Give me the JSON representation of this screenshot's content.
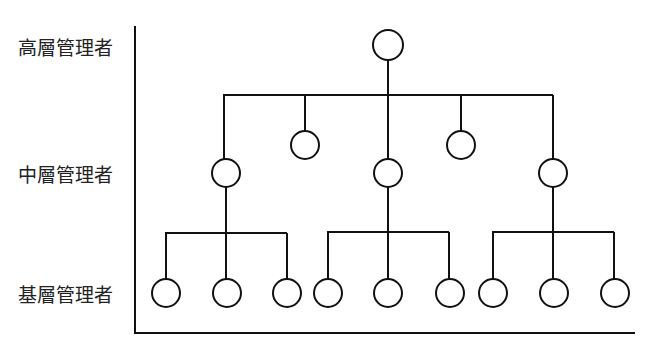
{
  "diagram": {
    "title": "",
    "type": "organization-hierarchy",
    "levels": [
      {
        "id": "top",
        "label": "高層管理者",
        "y": 45
      },
      {
        "id": "middle",
        "label": "中層管理者",
        "y": 173
      },
      {
        "id": "base",
        "label": "基層管理者",
        "y": 293
      }
    ],
    "colors": {
      "stroke": "#111111",
      "background": "#ffffff",
      "text": "#222222"
    },
    "nodes": [
      {
        "id": "top-manager",
        "level": "top",
        "x": 388,
        "y": 45
      },
      {
        "id": "staff-left",
        "level": "staff",
        "x": 305,
        "y": 145
      },
      {
        "id": "staff-right",
        "level": "staff",
        "x": 461,
        "y": 145
      },
      {
        "id": "mid-left",
        "level": "middle",
        "x": 226,
        "y": 173
      },
      {
        "id": "mid-center",
        "level": "middle",
        "x": 388,
        "y": 173
      },
      {
        "id": "mid-right",
        "level": "middle",
        "x": 553,
        "y": 173
      },
      {
        "id": "base-1",
        "level": "base",
        "x": 166,
        "y": 293
      },
      {
        "id": "base-2",
        "level": "base",
        "x": 227,
        "y": 293
      },
      {
        "id": "base-3",
        "level": "base",
        "x": 287,
        "y": 293
      },
      {
        "id": "base-4",
        "level": "base",
        "x": 328,
        "y": 293
      },
      {
        "id": "base-5",
        "level": "base",
        "x": 388,
        "y": 293
      },
      {
        "id": "base-6",
        "level": "base",
        "x": 450,
        "y": 293
      },
      {
        "id": "base-7",
        "level": "base",
        "x": 493,
        "y": 293
      },
      {
        "id": "base-8",
        "level": "base",
        "x": 554,
        "y": 293
      },
      {
        "id": "base-9",
        "level": "base",
        "x": 615,
        "y": 293
      }
    ]
  }
}
